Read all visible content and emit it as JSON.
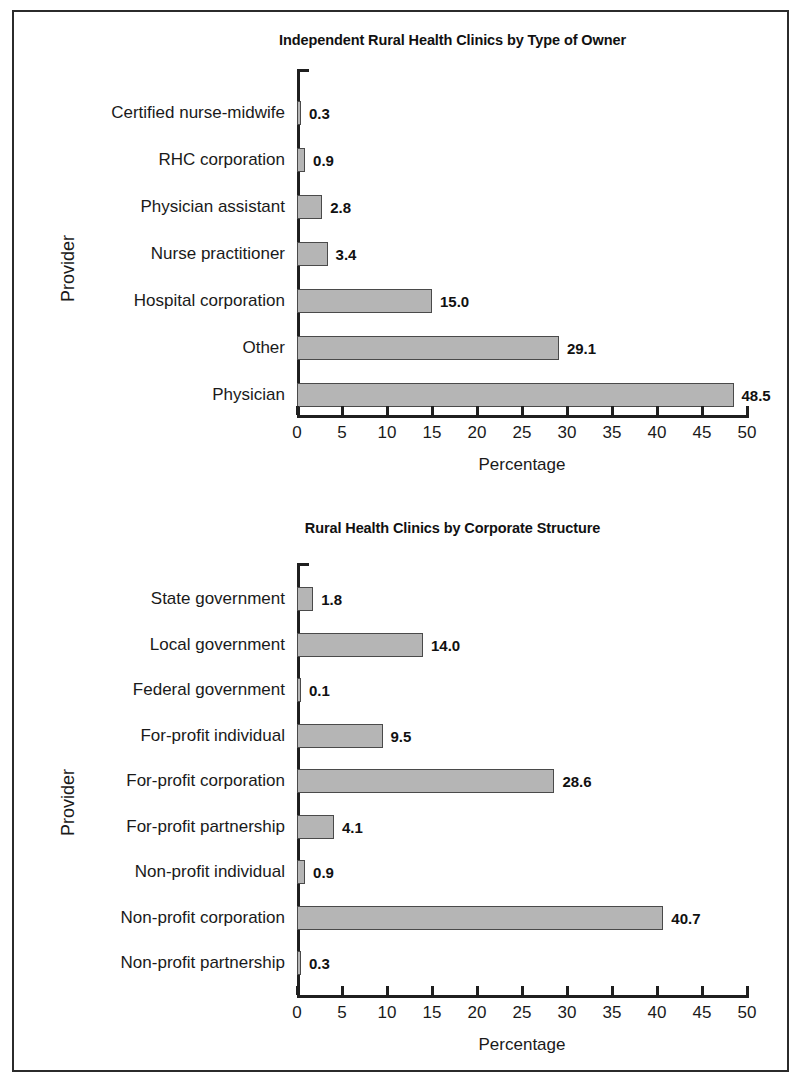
{
  "figure": {
    "border_color": "#2b2b2b",
    "bar_fill_color": "#b5b5b5",
    "bar_edge_color": "#4a4a4a"
  },
  "chart_data": [
    {
      "type": "bar",
      "orientation": "horizontal",
      "title": "Independent Rural Health Clinics by Type of Owner",
      "xlabel": "Percentage",
      "ylabel": "Provider",
      "xlim": [
        0,
        50
      ],
      "xticks": [
        0,
        5,
        10,
        15,
        20,
        25,
        30,
        35,
        40,
        45,
        50
      ],
      "xtick_labels": [
        "0",
        "5",
        "10",
        "15",
        "20",
        "25",
        "30",
        "35",
        "40",
        "45",
        "50"
      ],
      "grid": false,
      "legend": false,
      "categories": [
        "Certified nurse-midwife",
        "RHC corporation",
        "Physician assistant",
        "Nurse practitioner",
        "Hospital corporation",
        "Other",
        "Physician"
      ],
      "values": [
        0.3,
        0.9,
        2.8,
        3.4,
        15.0,
        29.1,
        48.5
      ],
      "value_labels": [
        "0.3",
        "0.9",
        "2.8",
        "3.4",
        "15.0",
        "29.1",
        "48.5"
      ]
    },
    {
      "type": "bar",
      "orientation": "horizontal",
      "title": "Rural Health Clinics by Corporate Structure",
      "xlabel": "Percentage",
      "ylabel": "Provider",
      "xlim": [
        0,
        50
      ],
      "xticks": [
        0,
        5,
        10,
        15,
        20,
        25,
        30,
        35,
        40,
        45,
        50
      ],
      "xtick_labels": [
        "0",
        "5",
        "10",
        "15",
        "20",
        "25",
        "30",
        "35",
        "40",
        "45",
        "50"
      ],
      "grid": false,
      "legend": false,
      "categories": [
        "State government",
        "Local government",
        "Federal government",
        "For-profit individual",
        "For-profit corporation",
        "For-profit partnership",
        "Non-profit individual",
        "Non-profit corporation",
        "Non-profit partnership"
      ],
      "values": [
        1.8,
        14.0,
        0.1,
        9.5,
        28.6,
        4.1,
        0.9,
        40.7,
        0.3
      ],
      "value_labels": [
        "1.8",
        "14.0",
        "0.1",
        "9.5",
        "28.6",
        "4.1",
        "0.9",
        "40.7",
        "0.3"
      ]
    }
  ]
}
